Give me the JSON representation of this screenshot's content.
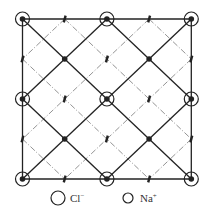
{
  "figure": {
    "grid": {
      "origin": [
        22.5,
        19
      ],
      "spacing": [
        42.2,
        40
      ],
      "size": 5
    },
    "colors": {
      "line": "#222222",
      "dashed": "#888888",
      "background": "#ffffff"
    },
    "cl_circled_points": [
      [
        0,
        0
      ],
      [
        2,
        0
      ],
      [
        4,
        0
      ],
      [
        0,
        2
      ],
      [
        2,
        2
      ],
      [
        4,
        2
      ],
      [
        0,
        4
      ],
      [
        2,
        4
      ],
      [
        4,
        4
      ]
    ],
    "cl_dot_points": [
      [
        1,
        1
      ],
      [
        3,
        1
      ],
      [
        1,
        3
      ],
      [
        3,
        3
      ]
    ],
    "na_points": [
      [
        1,
        0
      ],
      [
        3,
        0
      ],
      [
        0,
        1
      ],
      [
        2,
        1
      ],
      [
        4,
        1
      ],
      [
        1,
        2
      ],
      [
        3,
        2
      ],
      [
        0,
        3
      ],
      [
        2,
        3
      ],
      [
        4,
        3
      ],
      [
        1,
        4
      ],
      [
        3,
        4
      ]
    ]
  },
  "legend": {
    "items": [
      {
        "symbol": "large-circle",
        "label": "Cl",
        "charge": "−"
      },
      {
        "symbol": "small-circle",
        "label": "Na",
        "charge": "+"
      }
    ]
  }
}
